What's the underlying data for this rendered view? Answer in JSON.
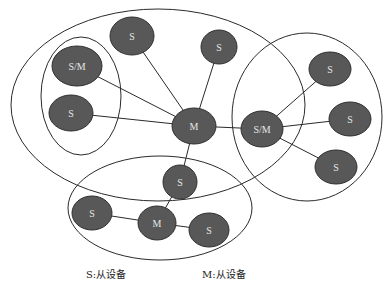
{
  "diagram": {
    "title": "",
    "colors": {
      "node_fill": "#585858",
      "node_text": "#e6e6e6",
      "line": "#2a2a2a",
      "background": "#ffffff"
    },
    "groups": [
      {
        "id": "piconet-main",
        "cx": 158,
        "cy": 105,
        "rx": 147,
        "ry": 96
      },
      {
        "id": "piconet-left",
        "cx": 81,
        "cy": 96,
        "rx": 40,
        "ry": 59
      },
      {
        "id": "piconet-right",
        "cx": 307,
        "cy": 117,
        "rx": 75,
        "ry": 84
      },
      {
        "id": "piconet-bottom",
        "cx": 160,
        "cy": 208,
        "rx": 92,
        "ry": 52
      }
    ],
    "nodes": [
      {
        "id": "n1",
        "label": "S",
        "cx": 132,
        "cy": 36,
        "rx": 22,
        "ry": 19
      },
      {
        "id": "n2",
        "label": "S",
        "cx": 219,
        "cy": 47,
        "rx": 18,
        "ry": 17
      },
      {
        "id": "n3",
        "label": "S/M",
        "cx": 77,
        "cy": 66,
        "rx": 25,
        "ry": 20
      },
      {
        "id": "n4",
        "label": "S",
        "cx": 71,
        "cy": 113,
        "rx": 22,
        "ry": 18
      },
      {
        "id": "n5",
        "label": "M",
        "cx": 194,
        "cy": 126,
        "rx": 22,
        "ry": 18
      },
      {
        "id": "n6",
        "label": "S/M",
        "cx": 262,
        "cy": 129,
        "rx": 21,
        "ry": 18
      },
      {
        "id": "n7",
        "label": "S",
        "cx": 330,
        "cy": 69,
        "rx": 21,
        "ry": 17
      },
      {
        "id": "n8",
        "label": "S",
        "cx": 350,
        "cy": 119,
        "rx": 21,
        "ry": 17
      },
      {
        "id": "n9",
        "label": "S",
        "cx": 336,
        "cy": 167,
        "rx": 21,
        "ry": 17
      },
      {
        "id": "n10",
        "label": "S",
        "cx": 180,
        "cy": 182,
        "rx": 17,
        "ry": 17
      },
      {
        "id": "n11",
        "label": "S",
        "cx": 92,
        "cy": 213,
        "rx": 20,
        "ry": 17
      },
      {
        "id": "n12",
        "label": "M",
        "cx": 157,
        "cy": 223,
        "rx": 19,
        "ry": 17
      },
      {
        "id": "n13",
        "label": "S",
        "cx": 209,
        "cy": 230,
        "rx": 20,
        "ry": 17
      }
    ],
    "edges": [
      [
        "n5",
        "n1"
      ],
      [
        "n5",
        "n2"
      ],
      [
        "n5",
        "n3"
      ],
      [
        "n5",
        "n4"
      ],
      [
        "n5",
        "n6"
      ],
      [
        "n5",
        "n10"
      ],
      [
        "n6",
        "n7"
      ],
      [
        "n6",
        "n8"
      ],
      [
        "n6",
        "n9"
      ],
      [
        "n10",
        "n12"
      ],
      [
        "n12",
        "n11"
      ],
      [
        "n12",
        "n13"
      ]
    ]
  },
  "legend": {
    "slave": "S:从设备",
    "master": "M:从设备"
  }
}
